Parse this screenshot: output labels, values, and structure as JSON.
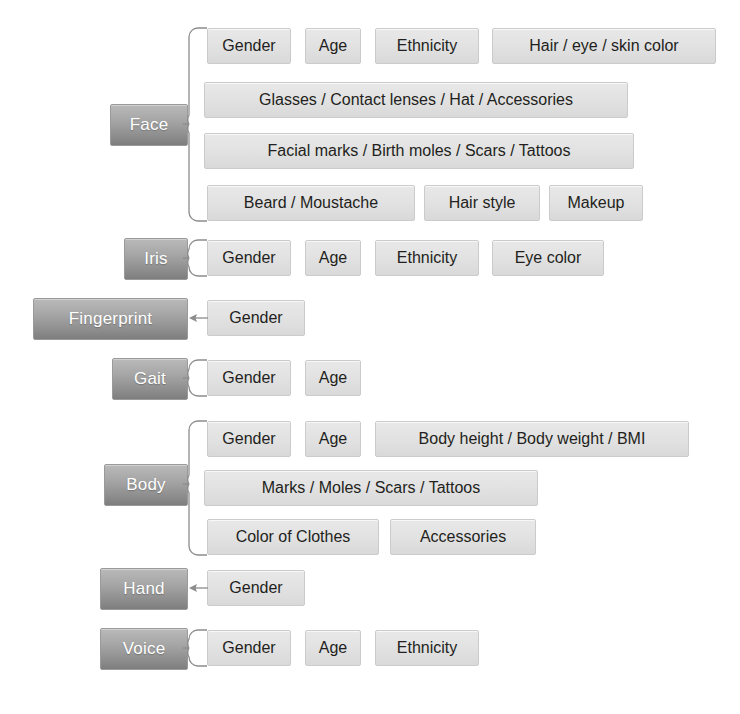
{
  "diagram": {
    "colors": {
      "background": "#ffffff",
      "modality_fill_top": "#b9b9b9",
      "modality_fill_bottom": "#7e7e7e",
      "modality_text": "#ffffff",
      "attribute_fill": "#e2e2e2",
      "attribute_border": "#cbcbcb",
      "attribute_text": "#231f20",
      "connector_stroke": "#8c8c8c"
    },
    "groups": [
      {
        "id": "face",
        "label": "Face",
        "connector": "brace",
        "rows": [
          [
            {
              "label": "Gender"
            },
            {
              "label": "Age"
            },
            {
              "label": "Ethnicity"
            },
            {
              "label": "Hair / eye / skin color"
            }
          ],
          [
            {
              "label": "Glasses / Contact lenses / Hat / Accessories"
            }
          ],
          [
            {
              "label": "Facial marks / Birth moles / Scars / Tattoos"
            }
          ],
          [
            {
              "label": "Beard / Moustache"
            },
            {
              "label": "Hair style"
            },
            {
              "label": "Makeup"
            }
          ]
        ]
      },
      {
        "id": "iris",
        "label": "Iris",
        "connector": "brace",
        "rows": [
          [
            {
              "label": "Gender"
            },
            {
              "label": "Age"
            },
            {
              "label": "Ethnicity"
            },
            {
              "label": "Eye color"
            }
          ]
        ]
      },
      {
        "id": "fingerprint",
        "label": "Fingerprint",
        "connector": "arrow",
        "rows": [
          [
            {
              "label": "Gender"
            }
          ]
        ]
      },
      {
        "id": "gait",
        "label": "Gait",
        "connector": "brace",
        "rows": [
          [
            {
              "label": "Gender"
            },
            {
              "label": "Age"
            }
          ]
        ]
      },
      {
        "id": "body",
        "label": "Body",
        "connector": "brace",
        "rows": [
          [
            {
              "label": "Gender"
            },
            {
              "label": "Age"
            },
            {
              "label": "Body height / Body weight / BMI"
            }
          ],
          [
            {
              "label": "Marks / Moles / Scars / Tattoos"
            }
          ],
          [
            {
              "label": "Color of Clothes"
            },
            {
              "label": "Accessories"
            }
          ]
        ]
      },
      {
        "id": "hand",
        "label": "Hand",
        "connector": "arrow",
        "rows": [
          [
            {
              "label": "Gender"
            }
          ]
        ]
      },
      {
        "id": "voice",
        "label": "Voice",
        "connector": "brace",
        "rows": [
          [
            {
              "label": "Gender"
            },
            {
              "label": "Age"
            },
            {
              "label": "Ethnicity"
            }
          ]
        ]
      }
    ]
  },
  "layout": {
    "modality_boxes": {
      "face": {
        "x": 110,
        "y": 104,
        "w": 78,
        "h": 42
      },
      "iris": {
        "x": 124,
        "y": 238,
        "w": 64,
        "h": 42
      },
      "fingerprint": {
        "x": 33,
        "y": 298,
        "w": 155,
        "h": 42
      },
      "gait": {
        "x": 112,
        "y": 358,
        "w": 76,
        "h": 42
      },
      "body": {
        "x": 104,
        "y": 464,
        "w": 84,
        "h": 42
      },
      "hand": {
        "x": 100,
        "y": 568,
        "w": 88,
        "h": 42
      },
      "voice": {
        "x": 100,
        "y": 628,
        "w": 88,
        "h": 42
      }
    },
    "attribute_boxes": {
      "face": [
        [
          {
            "x": 207,
            "y": 28,
            "w": 84,
            "h": 36
          },
          {
            "x": 305,
            "y": 28,
            "w": 56,
            "h": 36
          },
          {
            "x": 375,
            "y": 28,
            "w": 104,
            "h": 36
          },
          {
            "x": 492,
            "y": 28,
            "w": 224,
            "h": 36
          }
        ],
        [
          {
            "x": 204,
            "y": 82,
            "w": 424,
            "h": 36
          }
        ],
        [
          {
            "x": 204,
            "y": 133,
            "w": 430,
            "h": 36
          }
        ],
        [
          {
            "x": 207,
            "y": 185,
            "w": 208,
            "h": 36
          },
          {
            "x": 424,
            "y": 185,
            "w": 116,
            "h": 36
          },
          {
            "x": 549,
            "y": 185,
            "w": 94,
            "h": 36
          }
        ]
      ],
      "iris": [
        [
          {
            "x": 207,
            "y": 240,
            "w": 84,
            "h": 36
          },
          {
            "x": 305,
            "y": 240,
            "w": 56,
            "h": 36
          },
          {
            "x": 375,
            "y": 240,
            "w": 104,
            "h": 36
          },
          {
            "x": 492,
            "y": 240,
            "w": 112,
            "h": 36
          }
        ]
      ],
      "fingerprint": [
        [
          {
            "x": 207,
            "y": 300,
            "w": 98,
            "h": 36
          }
        ]
      ],
      "gait": [
        [
          {
            "x": 207,
            "y": 360,
            "w": 84,
            "h": 36
          },
          {
            "x": 305,
            "y": 360,
            "w": 56,
            "h": 36
          }
        ]
      ],
      "body": [
        [
          {
            "x": 207,
            "y": 421,
            "w": 84,
            "h": 36
          },
          {
            "x": 305,
            "y": 421,
            "w": 56,
            "h": 36
          },
          {
            "x": 375,
            "y": 421,
            "w": 314,
            "h": 36
          }
        ],
        [
          {
            "x": 204,
            "y": 470,
            "w": 334,
            "h": 36
          }
        ],
        [
          {
            "x": 207,
            "y": 519,
            "w": 172,
            "h": 36
          },
          {
            "x": 390,
            "y": 519,
            "w": 146,
            "h": 36
          }
        ]
      ],
      "hand": [
        [
          {
            "x": 207,
            "y": 570,
            "w": 98,
            "h": 36
          }
        ]
      ],
      "voice": [
        [
          {
            "x": 207,
            "y": 630,
            "w": 84,
            "h": 36
          },
          {
            "x": 305,
            "y": 630,
            "w": 56,
            "h": 36
          },
          {
            "x": 375,
            "y": 630,
            "w": 104,
            "h": 36
          }
        ]
      ]
    },
    "connectors": {
      "face": {
        "type": "brace",
        "x": 188,
        "top": 28,
        "bottom": 221,
        "mid": 125
      },
      "iris": {
        "type": "brace",
        "x": 188,
        "top": 240,
        "bottom": 276,
        "mid": 259
      },
      "fingerprint": {
        "type": "arrow",
        "x1": 207,
        "x2": 189,
        "y": 318
      },
      "gait": {
        "type": "brace",
        "x": 188,
        "top": 360,
        "bottom": 396,
        "mid": 379
      },
      "body": {
        "type": "brace",
        "x": 188,
        "top": 421,
        "bottom": 555,
        "mid": 485
      },
      "hand": {
        "type": "arrow",
        "x1": 207,
        "x2": 189,
        "y": 588
      },
      "voice": {
        "type": "brace",
        "x": 188,
        "top": 630,
        "bottom": 666,
        "mid": 649
      }
    }
  }
}
